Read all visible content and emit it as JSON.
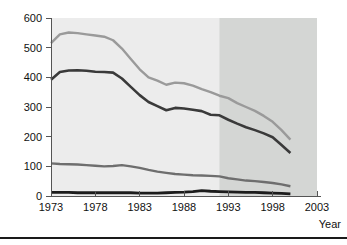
{
  "figure": {
    "name": "line-chart-figure",
    "background": "#ffffff",
    "footer_rule_color": "#1a1a1a"
  },
  "chart_data": {
    "type": "line",
    "title": "",
    "subtitle": "",
    "xlabel": "Year",
    "ylabel": "",
    "grid": false,
    "legend": "none",
    "xlim": [
      1973,
      2003
    ],
    "ylim": [
      0,
      600
    ],
    "xticks": [
      1973,
      1978,
      1983,
      1988,
      1993,
      1998,
      2003
    ],
    "xtick_labels": [
      "1973",
      "1978",
      "1983",
      "1988",
      "1993",
      "1998",
      "2003"
    ],
    "yticks": [
      0,
      100,
      200,
      300,
      400,
      500,
      600
    ],
    "ytick_labels": [
      "0",
      "100",
      "200",
      "300",
      "400",
      "500",
      "600"
    ],
    "plot_background": "#ececec",
    "shaded_region": {
      "label": "",
      "x_start": 1992,
      "x_end": 2003,
      "color": "#d4d6d4"
    },
    "x": [
      1973,
      1974,
      1975,
      1976,
      1977,
      1978,
      1979,
      1980,
      1981,
      1982,
      1983,
      1984,
      1985,
      1986,
      1987,
      1988,
      1989,
      1990,
      1991,
      1992,
      1993,
      1994,
      1995,
      1996,
      1997,
      1998,
      1999,
      2000
    ],
    "series": [
      {
        "name": "series-1-top",
        "color": "#9a9a9a",
        "width": 2.4,
        "values": [
          515,
          545,
          551,
          549,
          545,
          541,
          537,
          525,
          497,
          462,
          427,
          400,
          389,
          375,
          382,
          380,
          372,
          360,
          350,
          338,
          330,
          313,
          300,
          287,
          270,
          250,
          222,
          190
        ]
      },
      {
        "name": "series-2-second",
        "color": "#3a3a3a",
        "width": 2.6,
        "values": [
          392,
          418,
          423,
          424,
          422,
          419,
          418,
          416,
          396,
          368,
          340,
          317,
          303,
          289,
          297,
          295,
          291,
          286,
          274,
          272,
          257,
          244,
          232,
          222,
          211,
          198,
          172,
          145
        ]
      },
      {
        "name": "series-3-third",
        "color": "#6e6e6e",
        "width": 2.4,
        "values": [
          110,
          108,
          107,
          106,
          104,
          102,
          100,
          101,
          104,
          100,
          95,
          88,
          82,
          78,
          74,
          72,
          70,
          69,
          68,
          66,
          60,
          56,
          52,
          50,
          47,
          44,
          39,
          33
        ]
      },
      {
        "name": "series-4-bottom",
        "color": "#1c1c1c",
        "width": 2.8,
        "values": [
          12,
          12,
          12,
          11,
          11,
          11,
          11,
          11,
          11,
          11,
          10,
          10,
          10,
          11,
          12,
          13,
          15,
          18,
          16,
          15,
          14,
          13,
          12,
          12,
          11,
          10,
          9,
          7
        ]
      }
    ]
  }
}
